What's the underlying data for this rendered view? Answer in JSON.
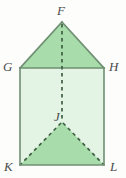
{
  "figure": {
    "kind": "geometry-solid-net-diagram",
    "colors": {
      "background": "#fdfdfc",
      "triangle_fill": "#a8dcab",
      "body_fill": "#e3f3e4",
      "solid_edge": "#6f8f72",
      "hidden_edge": "#3f5f42",
      "label_text": "#4c4c4c"
    },
    "vertices": [
      {
        "name": "F",
        "x": 62,
        "y": 22,
        "label": "F",
        "label_x": 57,
        "label_y": 4
      },
      {
        "name": "G",
        "x": 20,
        "y": 68,
        "label": "G",
        "label_x": 3,
        "label_y": 60
      },
      {
        "name": "H",
        "x": 104,
        "y": 68,
        "label": "H",
        "label_x": 109,
        "label_y": 60
      },
      {
        "name": "J",
        "x": 62,
        "y": 122,
        "label": "J",
        "label_x": 54,
        "label_y": 110
      },
      {
        "name": "K",
        "x": 20,
        "y": 165,
        "label": "K",
        "label_x": 4,
        "label_y": 160
      },
      {
        "name": "L",
        "x": 104,
        "y": 165,
        "label": "L",
        "label_x": 110,
        "label_y": 160
      }
    ],
    "solid_edges": [
      {
        "name": "edge-F-G",
        "from": "F",
        "to": "G"
      },
      {
        "name": "edge-F-H",
        "from": "F",
        "to": "H"
      },
      {
        "name": "edge-G-H",
        "from": "G",
        "to": "H"
      },
      {
        "name": "edge-G-K",
        "from": "G",
        "to": "K"
      },
      {
        "name": "edge-H-L",
        "from": "H",
        "to": "L"
      },
      {
        "name": "edge-K-L",
        "from": "K",
        "to": "L"
      }
    ],
    "hidden_edges": [
      {
        "name": "edge-F-J",
        "from": "F",
        "to": "J"
      },
      {
        "name": "edge-J-K",
        "from": "J",
        "to": "K"
      },
      {
        "name": "edge-J-L",
        "from": "J",
        "to": "L"
      }
    ],
    "faces": [
      {
        "name": "face-top-triangle-FGH",
        "points": "62,22 20,68 104,68",
        "fill": "triangle_fill"
      },
      {
        "name": "face-body-rectangle-GHLK",
        "points": "20,68 104,68 104,165 20,165",
        "fill": "body_fill"
      },
      {
        "name": "face-bottom-triangle-JKL",
        "points": "62,122 20,165 104,165",
        "fill": "triangle_fill"
      }
    ]
  }
}
